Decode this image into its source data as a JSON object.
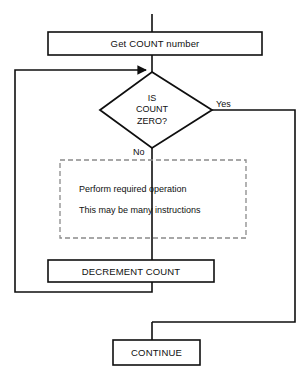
{
  "diagram": {
    "type": "flowchart",
    "stroke_color": "#0f0f0f",
    "fill_color": "#ffffff",
    "dashed_color": "#8a8a8a",
    "nodes": {
      "get_count": {
        "shape": "process",
        "label": "Get COUNT number"
      },
      "decision": {
        "shape": "decision",
        "line1": "IS",
        "line2": "COUNT",
        "line3": "ZERO?"
      },
      "operation": {
        "shape": "dashed-group",
        "line1": "Perform required operation",
        "line2": "This may be many instructions"
      },
      "decrement": {
        "shape": "process",
        "label": "DECREMENT COUNT"
      },
      "continue": {
        "shape": "process",
        "label": "CONTINUE"
      }
    },
    "edges": {
      "yes_label": "Yes",
      "no_label": "No"
    },
    "top_artifact": "  "
  }
}
